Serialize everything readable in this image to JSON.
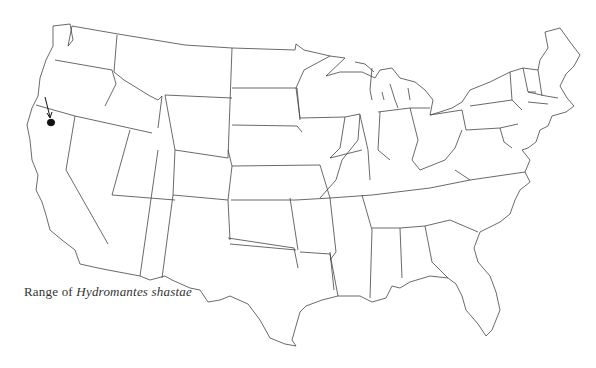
{
  "map": {
    "title": "Range of Hydromantes shastae",
    "caption": {
      "prefix": "Range of ",
      "species": "Hydromantes shastae"
    },
    "region": "Contiguous United States",
    "range_marker": {
      "location_label": "Northern California (Shasta area)",
      "fill": "#111111",
      "arrow": true
    },
    "colors": {
      "background": "#ffffff",
      "state_outline": "#444444",
      "range_fill": "#111111"
    }
  }
}
